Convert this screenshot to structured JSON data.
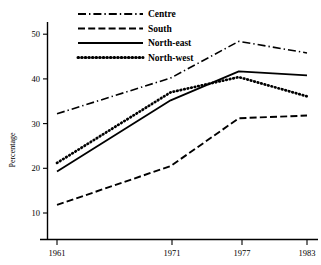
{
  "chart_data": {
    "type": "line",
    "title": "",
    "xlabel": "",
    "ylabel": "Percentage",
    "x": [
      1961,
      1971,
      1977,
      1983
    ],
    "xticklabels": [
      "1961",
      "1971",
      "1977",
      "1983"
    ],
    "yticks": [
      10,
      20,
      30,
      40,
      50
    ],
    "yticklabels": [
      "10",
      "20",
      "30",
      "40",
      "50"
    ],
    "ylim": [
      5,
      52
    ],
    "xlim": [
      1958.5,
      1985
    ],
    "grid": false,
    "legend_position": "top-left",
    "series": [
      {
        "name": "Centre",
        "style": "dash-dot",
        "values": [
          32.2,
          40.2,
          48.4,
          45.8
        ]
      },
      {
        "name": "South",
        "style": "dashed",
        "values": [
          11.8,
          20.5,
          31.2,
          31.8
        ]
      },
      {
        "name": "North-east",
        "style": "solid",
        "values": [
          19.3,
          35.2,
          41.7,
          40.8
        ]
      },
      {
        "name": "North-west",
        "style": "dotted",
        "values": [
          21.2,
          37.0,
          40.4,
          36.1
        ]
      }
    ]
  },
  "axis": {
    "y_title": "Percentage",
    "y_tick_0": "10",
    "y_tick_1": "20",
    "y_tick_2": "30",
    "y_tick_3": "40",
    "y_tick_4": "50",
    "x_tick_0": "1961",
    "x_tick_1": "1971",
    "x_tick_2": "1977",
    "x_tick_3": "1983"
  },
  "legend": {
    "items": [
      {
        "label": "Centre"
      },
      {
        "label": "South"
      },
      {
        "label": "North-east"
      },
      {
        "label": "North-west"
      }
    ]
  },
  "colors": {
    "ink": "#000000",
    "background": "#ffffff"
  }
}
